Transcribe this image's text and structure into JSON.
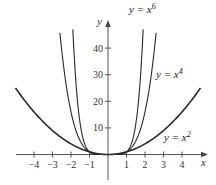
{
  "chart_data": {
    "type": "line",
    "title": "",
    "xlabel": "x",
    "ylabel": "y",
    "xlim": [
      -5,
      5
    ],
    "ylim": [
      -4,
      50
    ],
    "grid": false,
    "x_ticks": [
      -4,
      -3,
      -2,
      -1,
      1,
      2,
      3,
      4
    ],
    "x_tick_labels": [
      "−4",
      "−3",
      "−2",
      "−1",
      "1",
      "2",
      "3",
      "4"
    ],
    "y_ticks": [
      10,
      20,
      30,
      40
    ],
    "y_tick_labels": [
      "10",
      "20",
      "30",
      "40"
    ],
    "series": [
      {
        "name": "y = x^2",
        "label_base": "y = x",
        "label_exp": "2",
        "exponent": 2,
        "x": [
          -5,
          -4,
          -3,
          -2,
          -1,
          0,
          1,
          2,
          3,
          4,
          5
        ],
        "values": [
          25,
          16,
          9,
          4,
          1,
          0,
          1,
          4,
          9,
          16,
          25
        ],
        "stroke_width": 1.6
      },
      {
        "name": "y = x^4",
        "label_base": "y = x",
        "label_exp": "4",
        "exponent": 4,
        "x": [
          -2.6,
          -2,
          -1,
          0,
          1,
          2,
          2.6
        ],
        "values": [
          45.7,
          16,
          1,
          0,
          1,
          16,
          45.7
        ],
        "stroke_width": 1.1
      },
      {
        "name": "y = x^6",
        "label_base": "y = x",
        "label_exp": "6",
        "exponent": 6,
        "x": [
          -1.9,
          -1.5,
          -1,
          0,
          1,
          1.5,
          1.9
        ],
        "values": [
          47.0,
          11.4,
          1,
          0,
          1,
          11.4,
          47.0
        ],
        "stroke_width": 1.1
      }
    ],
    "annotations": [
      {
        "text": "y = x^6",
        "near": "top of x^6 curve"
      },
      {
        "text": "y = x^4",
        "near": "right of x^4 curve, y≈30"
      },
      {
        "text": "y = x^2",
        "near": "right of x^2 curve, y≈5"
      }
    ],
    "colors": {
      "curves": "#2a2a2a",
      "axes": "#444444",
      "text": "#333333"
    }
  }
}
